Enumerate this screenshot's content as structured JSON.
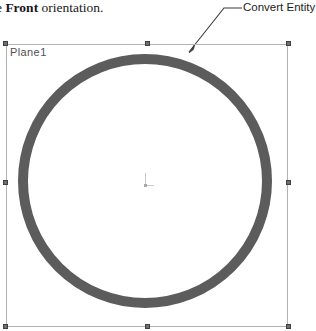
{
  "document": {
    "caption": {
      "prefix": "e ",
      "bold_word": "Front",
      "suffix": " orientation."
    }
  },
  "callout": {
    "label": "Convert Entity",
    "leader_icon": "leader-line-arrow-icon"
  },
  "sketch": {
    "plane_label": "Plane1",
    "origin_icon": "sketch-origin-icon",
    "circle_icon": "converted-circle-entity",
    "handles": [
      "top-left",
      "top-middle",
      "top-right",
      "middle-left",
      "middle-right",
      "bottom-left",
      "bottom-middle",
      "bottom-right"
    ]
  },
  "colors": {
    "plane_border": "#b2b2b4",
    "circle_stroke": "#5c5c5c",
    "handle_fill": "#6e6e72",
    "plane_label_text": "#4f4f54",
    "origin_marker": "#c9c9cc"
  }
}
